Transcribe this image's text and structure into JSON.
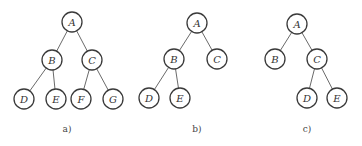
{
  "figure": {
    "trees": [
      {
        "caption": "a)",
        "caption_pos": [
          67,
          132
        ],
        "nodes": [
          {
            "id": "A",
            "x": 72,
            "y": 22
          },
          {
            "id": "B",
            "x": 52,
            "y": 60
          },
          {
            "id": "C",
            "x": 92,
            "y": 60
          },
          {
            "id": "D",
            "x": 24,
            "y": 99
          },
          {
            "id": "E",
            "x": 56,
            "y": 99
          },
          {
            "id": "F",
            "x": 81,
            "y": 99
          },
          {
            "id": "G",
            "x": 113,
            "y": 99
          }
        ],
        "edges": [
          [
            "A",
            "B"
          ],
          [
            "A",
            "C"
          ],
          [
            "B",
            "D"
          ],
          [
            "B",
            "E"
          ],
          [
            "C",
            "F"
          ],
          [
            "C",
            "G"
          ]
        ]
      },
      {
        "caption": "b)",
        "caption_pos": [
          197,
          132
        ],
        "nodes": [
          {
            "id": "A",
            "x": 197,
            "y": 23
          },
          {
            "id": "B",
            "x": 174,
            "y": 59
          },
          {
            "id": "C",
            "x": 217,
            "y": 59
          },
          {
            "id": "D",
            "x": 149,
            "y": 98
          },
          {
            "id": "E",
            "x": 180,
            "y": 98
          }
        ],
        "edges": [
          [
            "A",
            "B"
          ],
          [
            "A",
            "C"
          ],
          [
            "B",
            "D"
          ],
          [
            "B",
            "E"
          ]
        ]
      },
      {
        "caption": "c)",
        "caption_pos": [
          307,
          132
        ],
        "nodes": [
          {
            "id": "A",
            "x": 297,
            "y": 24
          },
          {
            "id": "B",
            "x": 275,
            "y": 59
          },
          {
            "id": "C",
            "x": 317,
            "y": 59
          },
          {
            "id": "D",
            "x": 307,
            "y": 98
          },
          {
            "id": "E",
            "x": 337,
            "y": 98
          }
        ],
        "edges": [
          [
            "A",
            "B"
          ],
          [
            "A",
            "C"
          ],
          [
            "C",
            "D"
          ],
          [
            "C",
            "E"
          ]
        ]
      }
    ],
    "node_radius": 10
  }
}
